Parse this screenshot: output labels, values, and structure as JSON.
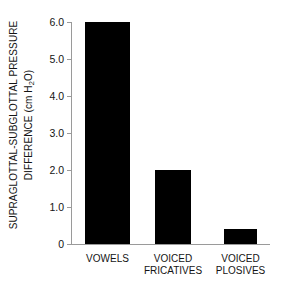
{
  "chart_data": {
    "type": "bar",
    "title": "",
    "xlabel": "",
    "ylabel_line1": "SUPRAGLOTTAL-SUBGLOTTAL PRESSURE",
    "ylabel_line2_pre": "DIFFERENCE (cm H",
    "ylabel_line2_sub": "2",
    "ylabel_line2_post": "O)",
    "ylabel_full": "SUPRAGLOTTAL-SUBGLOTTAL PRESSURE DIFFERENCE (cm H2O)",
    "yunit": "cm H2O",
    "categories": [
      "VOWELS",
      "VOICED FRICATIVES",
      "VOICED PLOSIVES"
    ],
    "category_lines": [
      [
        "VOWELS"
      ],
      [
        "VOICED",
        "FRICATIVES"
      ],
      [
        "VOICED",
        "PLOSIVES"
      ]
    ],
    "values": [
      6.0,
      2.0,
      0.4
    ],
    "ylim": [
      0,
      6.0
    ],
    "yticks": [
      6.0,
      5.0,
      4.0,
      3.0,
      2.0,
      1.0,
      0
    ],
    "ytick_labels": [
      "6.0",
      "5.0",
      "4.0",
      "3.0",
      "2.0",
      "1.0",
      "0"
    ],
    "grid": false,
    "legend": false,
    "bar_color": "#000000",
    "axis_color": "#9a9a9a",
    "background": "#ffffff"
  }
}
